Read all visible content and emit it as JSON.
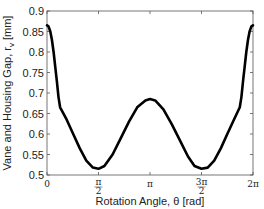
{
  "chart_data": {
    "type": "line",
    "title": "",
    "xlabel": "Rotation Angle, θ [rad]",
    "ylabel": "Vane and Housing Gap,  r_v  [mm]",
    "xlim": [
      0,
      6.2832
    ],
    "ylim": [
      0.5,
      0.9
    ],
    "x_ticks": [
      0,
      1.5708,
      3.1416,
      4.7124,
      6.2832
    ],
    "x_tick_labels": [
      "0",
      "π/2",
      "π",
      "3π/2",
      "2π"
    ],
    "y_ticks": [
      0.5,
      0.55,
      0.6,
      0.65,
      0.7,
      0.75,
      0.8,
      0.85,
      0.9
    ],
    "y_tick_labels": [
      "0.5",
      "0.55",
      "0.6",
      "0.65",
      "0.7",
      "0.75",
      "0.8",
      "0.85",
      "0.9"
    ],
    "grid": false,
    "legend": null,
    "series": [
      {
        "name": "vane-housing gap",
        "color": "#000000",
        "x": [
          0,
          0.05,
          0.1,
          0.15,
          0.2,
          0.25,
          0.3,
          0.35,
          0.4,
          0.6,
          0.8,
          1.0,
          1.2,
          1.4,
          1.5708,
          1.75,
          2.0,
          2.25,
          2.5,
          2.75,
          3.0,
          3.1416,
          3.3,
          3.55,
          3.8,
          4.05,
          4.3,
          4.5,
          4.7124,
          4.9,
          5.1,
          5.3,
          5.5,
          5.7,
          5.88,
          5.93,
          5.98,
          6.03,
          6.08,
          6.13,
          6.18,
          6.23,
          6.2832
        ],
        "y": [
          0.865,
          0.862,
          0.85,
          0.83,
          0.8,
          0.765,
          0.73,
          0.69,
          0.665,
          0.635,
          0.6,
          0.565,
          0.535,
          0.518,
          0.515,
          0.522,
          0.55,
          0.59,
          0.63,
          0.665,
          0.682,
          0.685,
          0.682,
          0.66,
          0.625,
          0.585,
          0.545,
          0.522,
          0.515,
          0.518,
          0.535,
          0.565,
          0.6,
          0.635,
          0.665,
          0.69,
          0.73,
          0.765,
          0.8,
          0.83,
          0.85,
          0.862,
          0.865
        ]
      }
    ]
  }
}
